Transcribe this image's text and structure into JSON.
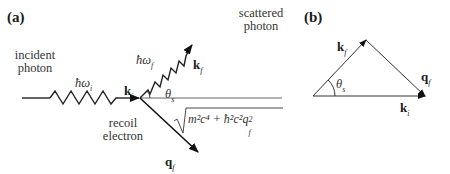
{
  "figure": {
    "panel_a": {
      "label": "(a)",
      "incident_photon_label": [
        "incident",
        "photon"
      ],
      "scattered_photon_label": [
        "scattered",
        "photon"
      ],
      "recoil_electron_label": [
        "recoil",
        "electron"
      ],
      "incident_energy": "ħω",
      "incident_energy_sub": "i",
      "scattered_energy": "ħω",
      "scattered_energy_sub": "f",
      "k_i": "k",
      "k_i_sub": "i",
      "k_f": "k",
      "k_f_sub": "f",
      "q_f": "q",
      "q_f_sub": "f",
      "theta": "θ",
      "theta_sub": "s",
      "electron_energy": "m²c⁴ + ħ²c²q",
      "electron_energy_sub": "f",
      "electron_energy_sup": "2"
    },
    "panel_b": {
      "label": "(b)",
      "k_f": "k",
      "k_f_sub": "f",
      "q_f": "q",
      "q_f_sub": "f",
      "k_i": "k",
      "k_i_sub": "i",
      "theta": "θ",
      "theta_sub": "s"
    }
  }
}
